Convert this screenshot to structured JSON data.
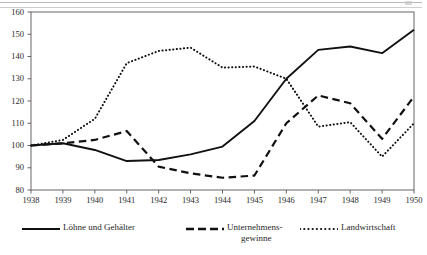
{
  "chart_data": {
    "type": "line",
    "title": "",
    "subtitle": "",
    "xlabel": "",
    "ylabel": "",
    "x": [
      1938,
      1939,
      1940,
      1941,
      1942,
      1943,
      1944,
      1945,
      1946,
      1947,
      1948,
      1949,
      1950
    ],
    "categories": [
      "1938",
      "1939",
      "1940",
      "1941",
      "1942",
      "1943",
      "1944",
      "1945",
      "1946",
      "1947",
      "1948",
      "1949",
      "1950"
    ],
    "xlim": [
      1938,
      1950
    ],
    "ylim": [
      80,
      160
    ],
    "yticks": [
      80,
      90,
      100,
      110,
      120,
      130,
      140,
      150,
      160
    ],
    "xticks": [
      "1938",
      "1939",
      "1940",
      "1941",
      "1942",
      "1943",
      "1944",
      "1945",
      "1946",
      "1947",
      "1948",
      "1949",
      "1950"
    ],
    "grid": false,
    "legend_position": "bottom",
    "series": [
      {
        "name": "Löhne und Gehälter",
        "style": "solid",
        "color": "#111111",
        "values": [
          100,
          101,
          98,
          93,
          93.5,
          96,
          99.5,
          111,
          130,
          143,
          144.5,
          141.5,
          152
        ]
      },
      {
        "name": "Unternehmensgewinne",
        "name_line1": "Unternehmens-",
        "name_line2": "gewinne",
        "style": "dashed",
        "color": "#111111",
        "values": [
          100,
          101,
          102.5,
          106.5,
          90.5,
          87.5,
          85.5,
          86.5,
          110,
          122.5,
          119,
          103,
          122
        ]
      },
      {
        "name": "Landwirtschaft",
        "style": "dotted",
        "color": "#111111",
        "values": [
          100,
          102.5,
          112,
          137,
          142.5,
          144,
          135,
          135.5,
          130,
          108.5,
          110.5,
          95,
          110
        ]
      }
    ]
  },
  "axis": {
    "y_tick_labels": [
      "160",
      "150",
      "140",
      "130",
      "120",
      "110",
      "100",
      "90",
      "80"
    ],
    "x_tick_labels": [
      "1938",
      "1939",
      "1940",
      "1941",
      "1942",
      "1943",
      "1944",
      "1945",
      "1946",
      "1947",
      "1948",
      "1949",
      "1950"
    ]
  },
  "legend": {
    "items": [
      {
        "label": "Löhne und Gehälter",
        "style": "solid"
      },
      {
        "label": "Unternehmens-",
        "label_line2": "gewinne",
        "style": "dashed"
      },
      {
        "label": "Landwirtschaft",
        "style": "dotted"
      }
    ]
  },
  "colors": {
    "ink": "#111111",
    "axis": "#555555",
    "background": "#ffffff"
  }
}
